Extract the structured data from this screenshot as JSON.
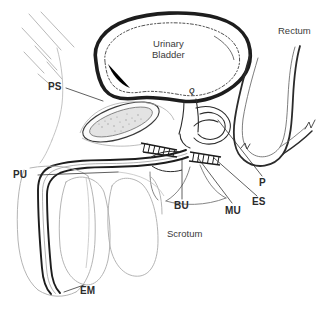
{
  "figure": {
    "kind": "anatomical-line-drawing",
    "background_color": "#ffffff",
    "ink_color": "#2b2b2b",
    "light_ink_color": "#8d8d8d"
  },
  "labels": {
    "urinary_bladder_line1": "Urinary",
    "urinary_bladder_line2": "Bladder",
    "rectum": "Rectum",
    "scrotum": "Scrotum",
    "ps": "PS",
    "pu": "PU",
    "bu": "BU",
    "mu": "MU",
    "es": "ES",
    "p": "P",
    "em": "EM",
    "bladder_neck_mark": "Q",
    "anal_mark_left": "w",
    "anal_mark_right": "vw"
  },
  "structures": [
    {
      "name": "urinary-bladder",
      "label": "Urinary Bladder"
    },
    {
      "name": "rectum",
      "label": "Rectum"
    },
    {
      "name": "scrotum",
      "label": "Scrotum"
    },
    {
      "name": "pubic-symphysis",
      "label": "PS"
    },
    {
      "name": "penile-urethra",
      "label": "PU"
    },
    {
      "name": "bulbar-urethra",
      "label": "BU"
    },
    {
      "name": "membranous-urethra",
      "label": "MU"
    },
    {
      "name": "external-sphincter",
      "label": "ES"
    },
    {
      "name": "prostate",
      "label": "P"
    },
    {
      "name": "external-meatus",
      "label": "EM"
    }
  ]
}
